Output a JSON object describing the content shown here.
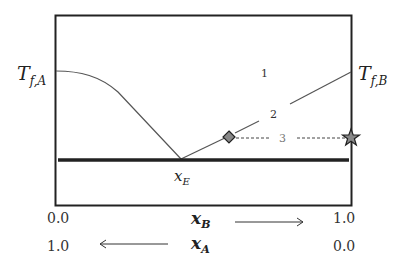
{
  "diagram": {
    "type": "binary eutectic phase diagram",
    "left_axis_label": {
      "main": "T",
      "sub": "f,A"
    },
    "right_axis_label": {
      "main": "T",
      "sub": "f,B"
    },
    "eutectic_label": {
      "main": "x",
      "sub": "E"
    },
    "region_labels": [
      "1",
      "2",
      "3"
    ],
    "x_axis_B": {
      "label_main": "x",
      "label_sub": "B",
      "start": "0.0",
      "end": "1.0",
      "arrow_direction": "right"
    },
    "x_axis_A": {
      "label_main": "x",
      "label_sub": "A",
      "start": "1.0",
      "end": "0.0",
      "arrow_direction": "left"
    },
    "markers": [
      {
        "name": "diamond",
        "color": "#888888"
      },
      {
        "name": "star",
        "color": "#888888"
      }
    ],
    "colors": {
      "frame": "#222222",
      "curve": "#555555",
      "eutectic_line": "#222222",
      "dashed": "#444444"
    }
  }
}
